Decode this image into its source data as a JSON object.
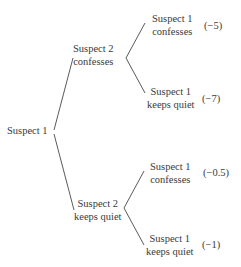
{
  "tree": {
    "root": {
      "label": "Suspect 1"
    },
    "level1": [
      {
        "line1": "Suspect 2",
        "line2": "confesses"
      },
      {
        "line1": "Suspect 2",
        "line2": "keeps quiet"
      }
    ],
    "leaves": [
      {
        "line1": "Suspect 1",
        "line2": "confesses",
        "payoff": "(−5)"
      },
      {
        "line1": "Suspect 1",
        "line2": "keeps quiet",
        "payoff": "(−7)"
      },
      {
        "line1": "Suspect 1",
        "line2": "confesses",
        "payoff": "(−0.5)"
      },
      {
        "line1": "Suspect 1",
        "line2": "keeps quiet",
        "payoff": "(−1)"
      }
    ]
  }
}
